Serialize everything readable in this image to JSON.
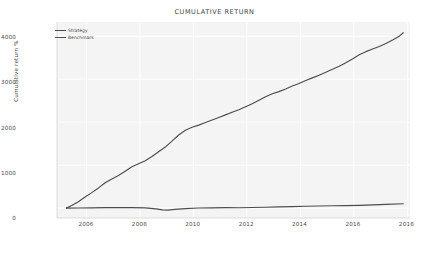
{
  "chart_data": {
    "type": "line",
    "title": "CUMULATIVE RETURN",
    "xlabel": "",
    "ylabel": "Cumulative return %",
    "xlim": [
      2004.9,
      2018.1
    ],
    "ylim": [
      -230,
      4330
    ],
    "xticks": [
      2006,
      2008,
      2010,
      2012,
      2014,
      2016,
      2018
    ],
    "xtick_labels": [
      "2006",
      "2008",
      "2010",
      "2012",
      "2014",
      "2016",
      "2018"
    ],
    "yticks": [
      0,
      1000,
      2000,
      3000,
      4000
    ],
    "ytick_labels": [
      "0",
      "1000",
      "2000",
      "3000",
      "4000"
    ],
    "grid": true,
    "grid_color": "#ffffff",
    "panel_color": "#f4f4f4",
    "figure_color": "#ffffff",
    "legend_position": "upper left",
    "line_color": "#4d4d4d",
    "series": [
      {
        "name": "Strategy",
        "color": "#4d4d4d",
        "x": [
          2005.25,
          2005.45,
          2005.7,
          2005.95,
          2006.2,
          2006.45,
          2006.7,
          2006.95,
          2007.2,
          2007.45,
          2007.7,
          2007.95,
          2008.2,
          2008.45,
          2008.7,
          2008.95,
          2009.2,
          2009.45,
          2009.7,
          2009.95,
          2010.2,
          2010.45,
          2010.7,
          2010.95,
          2011.2,
          2011.45,
          2011.7,
          2011.95,
          2012.2,
          2012.45,
          2012.7,
          2012.95,
          2013.2,
          2013.45,
          2013.7,
          2013.95,
          2014.2,
          2014.45,
          2014.7,
          2014.95,
          2015.2,
          2015.45,
          2015.7,
          2015.95,
          2016.2,
          2016.45,
          2016.7,
          2016.95,
          2017.2,
          2017.45,
          2017.7,
          2017.85
        ],
        "values": [
          0,
          60,
          150,
          260,
          360,
          470,
          590,
          680,
          760,
          860,
          960,
          1030,
          1100,
          1200,
          1310,
          1420,
          1560,
          1700,
          1810,
          1880,
          1930,
          1990,
          2050,
          2110,
          2170,
          2230,
          2290,
          2360,
          2430,
          2510,
          2590,
          2660,
          2710,
          2770,
          2840,
          2900,
          2970,
          3030,
          3090,
          3160,
          3230,
          3300,
          3380,
          3470,
          3570,
          3640,
          3700,
          3760,
          3830,
          3910,
          4000,
          4080
        ]
      },
      {
        "name": "Benchmark",
        "color": "#4d4d4d",
        "x": [
          2005.25,
          2005.7,
          2006.2,
          2006.7,
          2007.2,
          2007.7,
          2008.2,
          2008.6,
          2008.85,
          2009.05,
          2009.3,
          2009.7,
          2010.2,
          2010.7,
          2011.2,
          2011.7,
          2012.2,
          2012.7,
          2013.2,
          2013.7,
          2014.2,
          2014.7,
          2015.2,
          2015.7,
          2016.2,
          2016.7,
          2017.2,
          2017.85
        ],
        "values": [
          0,
          3,
          6,
          10,
          13,
          12,
          5,
          -18,
          -40,
          -46,
          -30,
          -12,
          2,
          6,
          10,
          8,
          14,
          20,
          28,
          36,
          44,
          50,
          55,
          58,
          64,
          74,
          88,
          102
        ]
      }
    ]
  },
  "axis": {
    "title": "CUMULATIVE RETURN",
    "ylabel": "Cumulative return %"
  },
  "legend": {
    "items": [
      {
        "label": "Strategy"
      },
      {
        "label": "Benchmark"
      }
    ]
  }
}
